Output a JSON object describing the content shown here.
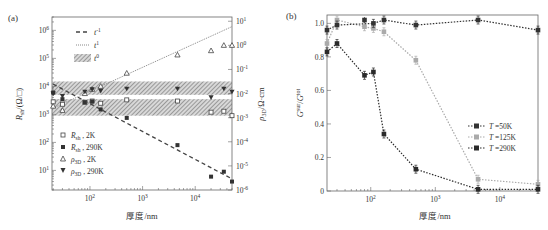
{
  "figure": {
    "panels": [
      "(a)",
      "(b)"
    ]
  },
  "chart_data": [
    {
      "panel_label": "(a)",
      "type": "scatter",
      "xscale": "log",
      "yscale": "log",
      "xlabel": "厚度/nm",
      "ylabel_left": "R_sh/(Ω/□)",
      "ylabel_right": "ρ_3D/Ω·cm",
      "xlim": [
        19,
        50000
      ],
      "ylim_left": [
        2,
        3000000
      ],
      "ylim_right": [
        1e-06,
        15
      ],
      "xticks": [
        "10^2",
        "10^3",
        "10^4"
      ],
      "yticks_left": [
        "10^1",
        "10^2",
        "10^3",
        "10^4",
        "10^5",
        "10^6"
      ],
      "yticks_right": [
        "10^-6",
        "10^-5",
        "10^-4",
        "10^-3",
        "10^-2",
        "10^-1",
        "10^0",
        "10^1"
      ],
      "legend_lines": [
        {
          "label": "t^-1",
          "style": "dashed"
        },
        {
          "label": "t^1",
          "style": "dotted"
        },
        {
          "label": "t^0",
          "style": "hatched-band"
        }
      ],
      "legend_markers": [
        {
          "label": "R_sh , 2K",
          "marker": "open-square"
        },
        {
          "label": "R_sh , 290K",
          "marker": "filled-square"
        },
        {
          "label": "ρ_3D , 2K",
          "marker": "open-triangle-up"
        },
        {
          "label": "ρ_3D , 290K",
          "marker": "filled-triangle-down"
        }
      ],
      "bands_left_axis": [
        {
          "from": 5000,
          "to": 15000
        },
        {
          "from": 900,
          "to": 3500
        }
      ],
      "series": [
        {
          "name": "R_sh, 2K",
          "axis": "left",
          "x": [
            20,
            30,
            80,
            110,
            160,
            500,
            4600,
            20000,
            35000,
            50000
          ],
          "y": [
            2800,
            2300,
            2700,
            3000,
            2500,
            3300,
            3000,
            1200,
            1300,
            900
          ]
        },
        {
          "name": "R_sh, 290K",
          "axis": "left",
          "x": [
            20,
            30,
            80,
            110,
            160,
            500,
            4600,
            20000,
            35000,
            50000
          ],
          "y": [
            6000,
            3500,
            2700,
            2900,
            1500,
            750,
            80,
            6,
            9,
            4
          ]
        },
        {
          "name": "ρ_3D, 2K",
          "axis": "right",
          "x": [
            20,
            30,
            80,
            110,
            160,
            500,
            4600,
            20000,
            35000,
            50000
          ],
          "y": [
            0.003,
            0.002,
            0.01,
            0.015,
            0.02,
            0.07,
            0.4,
            0.6,
            1.0,
            1.0
          ]
        },
        {
          "name": "ρ_3D, 290K",
          "axis": "right",
          "x": [
            20,
            30,
            80,
            110,
            160,
            500,
            4600,
            20000,
            35000,
            50000
          ],
          "y": [
            0.01,
            0.008,
            0.012,
            0.015,
            0.013,
            0.016,
            0.016,
            0.007,
            0.016,
            0.012
          ]
        },
        {
          "name": "t^-1 fit",
          "axis": "left",
          "style": "dashed",
          "x": [
            20,
            50000
          ],
          "y": [
            12000,
            5
          ]
        },
        {
          "name": "t^1 fit",
          "axis": "right",
          "style": "dotted",
          "x": [
            20,
            50000
          ],
          "y": [
            0.0025,
            6
          ]
        }
      ]
    },
    {
      "panel_label": "(b)",
      "type": "line",
      "xscale": "log",
      "yscale": "linear",
      "xlabel": "厚度/nm",
      "ylabel": "G^sur/G^tot",
      "xlim": [
        21,
        39000
      ],
      "ylim": [
        0,
        1.05
      ],
      "xticks": [
        "10^2",
        "10^3",
        "10^4"
      ],
      "yticks": [
        "0",
        "0.2",
        "0.4",
        "0.6",
        "0.8",
        "1.0"
      ],
      "legend": [
        "T =50K",
        "T =125K",
        "T =290K"
      ],
      "series": [
        {
          "name": "T =50K",
          "color": "#333333",
          "x": [
            21,
            30,
            110,
            160,
            500,
            4600,
            39000
          ],
          "y": [
            0.96,
            0.99,
            1.0,
            1.02,
            0.99,
            1.02,
            0.96
          ]
        },
        {
          "name": "T =125K",
          "color": "#aaaaaa",
          "x": [
            21,
            30,
            80,
            110,
            160,
            500,
            4600,
            39000
          ],
          "y": [
            0.88,
            1.02,
            0.98,
            0.97,
            0.95,
            0.78,
            0.07,
            0.04
          ]
        },
        {
          "name": "T =290K",
          "color": "#2a2a2a",
          "x": [
            21,
            30,
            80,
            110,
            160,
            500,
            4600,
            39000
          ],
          "y": [
            0.83,
            0.88,
            0.69,
            0.71,
            0.34,
            0.13,
            0.01,
            0.01
          ]
        },
        {
          "name": "T =50K (extra point)",
          "color": "#333333",
          "x": [
            80
          ],
          "y": [
            1.02
          ]
        }
      ]
    }
  ]
}
